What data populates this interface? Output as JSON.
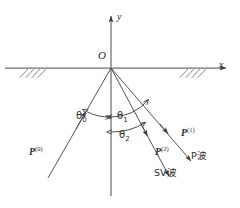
{
  "figure": {
    "type": "physics-ray-diagram",
    "colors": {
      "line": "#3a3a3a",
      "text": "#2b2b2b",
      "background": "#ffffff"
    },
    "axes": {
      "x_label": "x",
      "y_label": "y",
      "origin_label": "O"
    },
    "angles": [
      {
        "id": "theta0",
        "symbol": "θ",
        "subscript": "0",
        "side": "left"
      },
      {
        "id": "theta1",
        "symbol": "θ",
        "subscript": "1",
        "side": "right"
      },
      {
        "id": "theta2",
        "symbol": "θ",
        "subscript": "2",
        "side": "right"
      }
    ],
    "rays": [
      {
        "id": "incident",
        "symbol": "P",
        "superscript": "(0)"
      },
      {
        "id": "reflected-p",
        "symbol": "P",
        "superscript": "(1)"
      },
      {
        "id": "reflected-sv",
        "symbol": "P",
        "superscript": "(2)"
      }
    ],
    "wave_labels": [
      {
        "id": "p-wave",
        "text": "P波"
      },
      {
        "id": "sv-wave",
        "text": "SV波"
      }
    ],
    "surface": {
      "hatching": "free-surface-hatching"
    }
  }
}
